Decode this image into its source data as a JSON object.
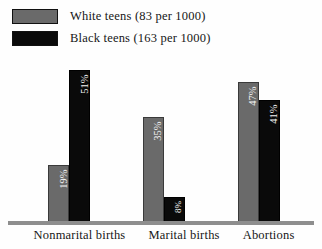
{
  "chart_data": {
    "type": "bar",
    "title": "",
    "xlabel": "",
    "ylabel": "",
    "ylim": [
      0,
      55
    ],
    "grid": false,
    "legend_position": "top-left",
    "categories": [
      "Nonmarital births",
      "Marital births",
      "Abortions"
    ],
    "series": [
      {
        "name": "White teens (83 per 1000)",
        "color": "#6a6a6a",
        "values": [
          19,
          35,
          47
        ],
        "value_labels": [
          "19%",
          "35%",
          "47%"
        ]
      },
      {
        "name": "Black teens (163 per 1000)",
        "color": "#0a0a0a",
        "values": [
          51,
          8,
          41
        ],
        "value_labels": [
          "51%",
          "8%",
          "41%"
        ]
      }
    ]
  },
  "legend": {
    "items": [
      {
        "label": "White teens (83 per 1000)",
        "color": "#6a6a6a"
      },
      {
        "label": "Black teens (163 per 1000)",
        "color": "#0a0a0a"
      }
    ]
  }
}
